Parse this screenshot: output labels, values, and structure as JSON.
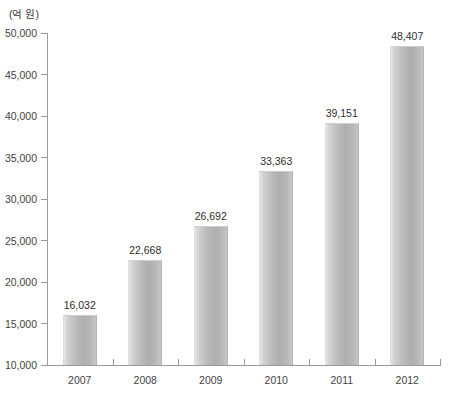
{
  "chart_data": {
    "type": "bar",
    "title": "",
    "subtitle": "",
    "xlabel": "",
    "ylabel": "(억 원)",
    "unit_caption": "(억 원)",
    "categories": [
      "2007",
      "2008",
      "2009",
      "2010",
      "2011",
      "2012"
    ],
    "values": [
      16032,
      22668,
      26692,
      33363,
      39151,
      48407
    ],
    "value_labels": [
      "16,032",
      "22,668",
      "26,692",
      "33,363",
      "39,151",
      "48,407"
    ],
    "ylim": [
      10000,
      50000
    ],
    "ytick_values": [
      10000,
      15000,
      20000,
      25000,
      30000,
      35000,
      40000,
      45000,
      50000
    ],
    "ytick_labels": [
      "10,000",
      "15,000",
      "20,000",
      "25,000",
      "30,000",
      "35,000",
      "40,000",
      "45,000",
      "50,000"
    ],
    "grid": false,
    "legend": null,
    "legend_position": "none",
    "series": [
      {
        "name": "",
        "values": [
          16032,
          22668,
          26692,
          33363,
          39151,
          48407
        ]
      }
    ],
    "colors": {
      "bar_light": "#e6e6e6",
      "bar_mid": "#b9b9b9",
      "bar_dark": "#aeaeae",
      "axis": "#9a9a9a",
      "text": "#3f3f3f",
      "background": "#ffffff"
    }
  }
}
